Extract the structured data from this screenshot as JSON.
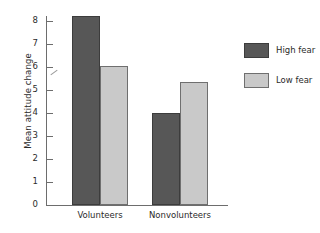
{
  "chart_data": {
    "type": "bar",
    "title": "",
    "xlabel": "",
    "ylabel": "Mean attitude change",
    "categories": [
      "Volunteers",
      "Nonvolunteers"
    ],
    "series": [
      {
        "name": "High fear",
        "color": "#575757",
        "values": [
          8.2,
          4.0
        ]
      },
      {
        "name": "Low fear",
        "color": "#c9c9c9",
        "values": [
          6.05,
          5.35
        ]
      }
    ],
    "ylim": [
      0,
      8
    ],
    "yticks": [
      0,
      1,
      2,
      3,
      4,
      5,
      6,
      7,
      8
    ],
    "ytick_labels": [
      "0",
      "1",
      "2",
      "3",
      "4",
      "5",
      "6",
      "7",
      "8"
    ],
    "grid": false,
    "legend_position": "right",
    "axis_color": "#6d6d6d"
  },
  "legend": {
    "entries": [
      {
        "label": "High fear"
      },
      {
        "label": "Low fear"
      }
    ]
  }
}
